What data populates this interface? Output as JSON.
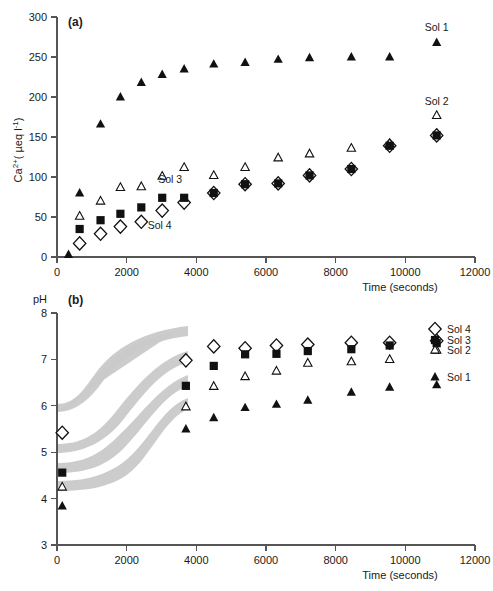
{
  "figure": {
    "background_color": "#ffffff",
    "marker_color": "#111111",
    "band_color": "#c9c9c9",
    "axis_color": "#555555"
  },
  "panel_a": {
    "label": "(a)",
    "ylabel": "Ca",
    "ylabel_super": "2+",
    "ylabel_rest": "( µeq l",
    "ylabel_exp": "-1",
    "ylabel_close": ")",
    "ylabel_full": "Ca2+( µeq l-1)",
    "xlabel": "Time (seconds)",
    "ytick_labels": [
      "0",
      "50",
      "100",
      "150",
      "200",
      "250",
      "300"
    ],
    "xtick_labels": [
      "0",
      "2000",
      "4000",
      "6000",
      "8000",
      "10000",
      "12000"
    ],
    "annotations": [
      {
        "text": "Sol 1",
        "x": 10900,
        "y": 283
      },
      {
        "text": "Sol 2",
        "x": 10900,
        "y": 190
      },
      {
        "text": "Sol 3",
        "x": 3250,
        "y": 92
      },
      {
        "text": "Sol 4",
        "x": 2950,
        "y": 35
      }
    ]
  },
  "panel_b": {
    "label": "(b)",
    "ylabel": "pH",
    "xlabel": "Time (seconds)",
    "ytick_labels": [
      "3",
      "4",
      "5",
      "6",
      "7",
      "8"
    ],
    "xtick_labels": [
      "0",
      "2000",
      "4000",
      "6000",
      "8000",
      "10000",
      "12000"
    ],
    "legend": [
      {
        "label": "Sol 4",
        "marker": "open-diamond"
      },
      {
        "label": "Sol 3",
        "marker": "filled-square"
      },
      {
        "label": "Sol 2",
        "marker": "open-triangle"
      },
      {
        "label": "Sol 1",
        "marker": "filled-triangle"
      }
    ]
  },
  "chart_data": [
    {
      "type": "scatter",
      "panel": "(a)",
      "title": "",
      "xlabel": "Time (seconds)",
      "ylabel": "Ca2+ ( µeq l-1)",
      "xlim": [
        0,
        12000
      ],
      "ylim": [
        0,
        300
      ],
      "xticks": [
        0,
        2000,
        4000,
        6000,
        8000,
        10000,
        12000
      ],
      "yticks": [
        0,
        50,
        100,
        150,
        200,
        250,
        300
      ],
      "grid": false,
      "legend_position": "inline-annotations",
      "series": [
        {
          "name": "Sol 1",
          "marker": "filled-triangle",
          "x": [
            330,
            650,
            1250,
            1820,
            2420,
            3020,
            3650,
            4500,
            5400,
            6350,
            7250,
            8450,
            9550,
            10900
          ],
          "y": [
            3,
            80,
            166,
            200,
            218,
            228,
            235,
            241,
            243,
            247,
            249,
            250,
            250,
            268
          ]
        },
        {
          "name": "Sol 2",
          "marker": "open-triangle",
          "x": [
            650,
            1250,
            1820,
            2420,
            3020,
            3650,
            4500,
            5400,
            6350,
            7250,
            8450,
            9550,
            10900
          ],
          "y": [
            51,
            70,
            87,
            88,
            101,
            112,
            102,
            112,
            124,
            129,
            136,
            142,
            177
          ]
        },
        {
          "name": "Sol 3",
          "marker": "filled-square",
          "x": [
            650,
            1250,
            1820,
            2420,
            3020,
            3650,
            4500,
            5400,
            6350,
            7250,
            8450,
            9550,
            10900
          ],
          "y": [
            35,
            46,
            54,
            62,
            74,
            74,
            80,
            91,
            92,
            102,
            110,
            139,
            152
          ]
        },
        {
          "name": "Sol 4",
          "marker": "open-diamond",
          "x": [
            650,
            1250,
            1820,
            2420,
            3020,
            3650,
            4500,
            5400,
            6350,
            7250,
            8450,
            9550,
            10900
          ],
          "y": [
            17,
            29,
            38,
            44,
            58,
            68,
            80,
            91,
            92,
            102,
            110,
            139,
            152
          ]
        }
      ]
    },
    {
      "type": "scatter",
      "panel": "(b)",
      "title": "",
      "xlabel": "Time (seconds)",
      "ylabel": "pH",
      "xlim": [
        0,
        12000
      ],
      "ylim": [
        3,
        8
      ],
      "xticks": [
        0,
        2000,
        4000,
        6000,
        8000,
        10000,
        12000
      ],
      "yticks": [
        3,
        4,
        5,
        6,
        7,
        8
      ],
      "grid": false,
      "legend_position": "right",
      "series": [
        {
          "name": "Sol 4",
          "marker": "open-diamond",
          "x": [
            150,
            3700,
            4500,
            5400,
            6300,
            7200,
            8450,
            9550,
            10900
          ],
          "y": [
            5.42,
            6.98,
            7.28,
            7.24,
            7.3,
            7.32,
            7.36,
            7.36,
            7.4
          ]
        },
        {
          "name": "Sol 3",
          "marker": "filled-square",
          "x": [
            150,
            3700,
            4500,
            5400,
            6300,
            7200,
            8450,
            9550,
            10900
          ],
          "y": [
            4.56,
            6.43,
            6.86,
            7.11,
            7.12,
            7.18,
            7.22,
            7.3,
            7.35
          ]
        },
        {
          "name": "Sol 2",
          "marker": "open-triangle",
          "x": [
            150,
            3700,
            4500,
            5400,
            6300,
            7200,
            8450,
            9550,
            10900
          ],
          "y": [
            4.25,
            5.98,
            6.42,
            6.63,
            6.75,
            6.92,
            6.95,
            7.0,
            7.2
          ]
        },
        {
          "name": "Sol 1",
          "marker": "filled-triangle",
          "x": [
            150,
            3700,
            4500,
            5400,
            6300,
            7200,
            8450,
            9550,
            10900
          ],
          "y": [
            3.84,
            5.5,
            5.74,
            5.96,
            6.03,
            6.12,
            6.29,
            6.4,
            6.45
          ]
        }
      ],
      "shaded_bands": [
        {
          "name": "Sol 4 band",
          "from_pH": 5.4,
          "to_pH": 7.0,
          "from_t": 0,
          "to_t": 3750
        },
        {
          "name": "Sol 3 band",
          "from_pH": 4.55,
          "to_pH": 6.45,
          "from_t": 0,
          "to_t": 3750
        },
        {
          "name": "Sol 2 band",
          "from_pH": 4.25,
          "to_pH": 6.0,
          "from_t": 0,
          "to_t": 3750
        },
        {
          "name": "Sol 1 band",
          "from_pH": 3.85,
          "to_pH": 5.5,
          "from_t": 0,
          "to_t": 3750
        }
      ]
    }
  ]
}
